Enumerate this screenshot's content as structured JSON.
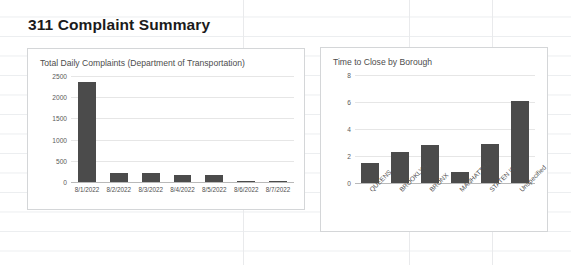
{
  "page_title": "311 Complaint Summary",
  "theme": {
    "bar_color": "#4b4b4b",
    "card_border": "#d4d6d8",
    "grid_color": "#e6e6e6",
    "text_color": "#4f4f4f",
    "title_color": "#1b1b1b"
  },
  "chart_data": [
    {
      "id": "daily_complaints",
      "type": "bar",
      "title": "Total Daily Complaints (Department of Transportation)",
      "xlabel": "",
      "ylabel": "",
      "categories": [
        "8/1/2022",
        "8/2/2022",
        "8/3/2022",
        "8/4/2022",
        "8/5/2022",
        "8/6/2022",
        "8/7/2022"
      ],
      "values": [
        2370,
        215,
        215,
        160,
        175,
        25,
        25
      ],
      "yticks": [
        0,
        500,
        1000,
        1500,
        2000,
        2500
      ],
      "ylim": [
        0,
        2500
      ],
      "grid": true,
      "legend": "none"
    },
    {
      "id": "time_to_close",
      "type": "bar",
      "title": "Time to Close by Borough",
      "xlabel": "",
      "ylabel": "",
      "categories": [
        "QUEENS",
        "BROOKLYN",
        "BRONX",
        "MANHATTAN",
        "STATEN IS...",
        "Unspecified"
      ],
      "values": [
        1.5,
        2.3,
        2.85,
        0.85,
        2.9,
        6.1
      ],
      "yticks": [
        0,
        2,
        4,
        6,
        8
      ],
      "ylim": [
        0,
        8
      ],
      "grid": true,
      "legend": "none"
    }
  ]
}
